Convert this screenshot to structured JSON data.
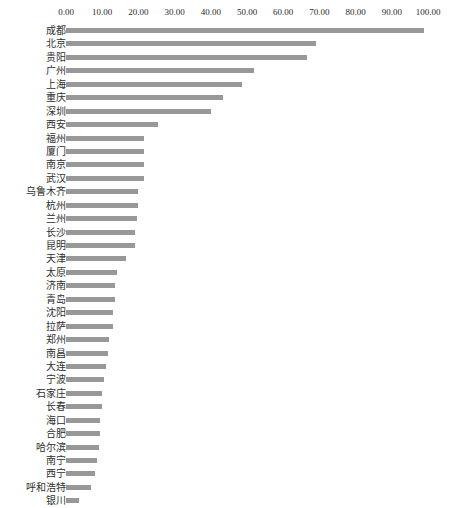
{
  "chart": {
    "type": "bar",
    "orientation": "horizontal",
    "bar_color": "#989898",
    "background_color": "#ffffff",
    "axis_position": "top",
    "grid": false,
    "legend": false
  },
  "axis": {
    "x_tick_labels": [
      "0.00",
      "10.00",
      "20.00",
      "30.00",
      "40.00",
      "50.00",
      "60.00",
      "70.00",
      "80.00",
      "90.00",
      "100.00"
    ],
    "x_min": 0,
    "x_max": 100,
    "x_step": 10
  },
  "chart_data": {
    "type": "bar",
    "title": "",
    "subtitle": "",
    "xlabel": "",
    "ylabel": "",
    "xlim": [
      0,
      100
    ],
    "grid": false,
    "legend_position": "none",
    "orientation": "horizontal",
    "categories": [
      "成都",
      "北京",
      "贵阳",
      "广州",
      "上海",
      "重庆",
      "深圳",
      "西安",
      "福州",
      "厦门",
      "南京",
      "武汉",
      "乌鲁木齐",
      "杭州",
      "兰州",
      "长沙",
      "昆明",
      "天津",
      "太原",
      "济南",
      "青岛",
      "沈阳",
      "拉萨",
      "郑州",
      "南昌",
      "大连",
      "宁波",
      "石家庄",
      "长春",
      "海口",
      "合肥",
      "哈尔滨",
      "南宁",
      "西宁",
      "呼和浩特",
      "银川"
    ],
    "values": [
      99.0,
      69.0,
      66.5,
      52.0,
      48.5,
      43.5,
      40.0,
      25.5,
      21.5,
      21.5,
      21.5,
      21.5,
      20.0,
      20.0,
      19.5,
      19.0,
      19.0,
      16.5,
      14.0,
      13.5,
      13.5,
      13.0,
      13.0,
      12.0,
      11.5,
      11.0,
      10.5,
      10.0,
      10.0,
      9.5,
      9.5,
      9.0,
      8.5,
      8.0,
      7.0,
      3.5
    ],
    "series": [
      {
        "name": "",
        "values": [
          99.0,
          69.0,
          66.5,
          52.0,
          48.5,
          43.5,
          40.0,
          25.5,
          21.5,
          21.5,
          21.5,
          21.5,
          20.0,
          20.0,
          19.5,
          19.0,
          19.0,
          16.5,
          14.0,
          13.5,
          13.5,
          13.0,
          13.0,
          12.0,
          11.5,
          11.0,
          10.5,
          10.0,
          10.0,
          9.5,
          9.5,
          9.0,
          8.5,
          8.0,
          7.0,
          3.5
        ]
      }
    ]
  }
}
